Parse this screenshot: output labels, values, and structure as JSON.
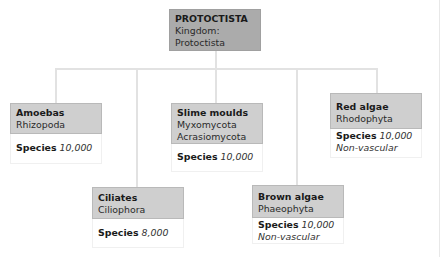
{
  "root": {
    "title": "PROTOCTISTA",
    "line1": "Kingdom:",
    "line2": "Protoctista"
  },
  "species_label": "Species",
  "children": [
    {
      "title": "Amoebas",
      "phylum": [
        "Rhizopoda"
      ],
      "species": "10,000",
      "note": ""
    },
    {
      "title": "Ciliates",
      "phylum": [
        "Ciliophora"
      ],
      "species": "8,000",
      "note": ""
    },
    {
      "title": "Slime moulds",
      "phylum": [
        "Myxomycota",
        "Acrasiomycota"
      ],
      "species": "10,000",
      "note": ""
    },
    {
      "title": "Brown algae",
      "phylum": [
        "Phaeophyta"
      ],
      "species": "10,000",
      "note": "Non-vascular"
    },
    {
      "title": "Red algae",
      "phylum": [
        "Rhodophyta"
      ],
      "species": "10,000",
      "note": "Non-vascular"
    }
  ],
  "colors": {
    "root_fill": "#ababab",
    "child_fill": "#cfcfcf",
    "connector": "#e2e2e2"
  }
}
